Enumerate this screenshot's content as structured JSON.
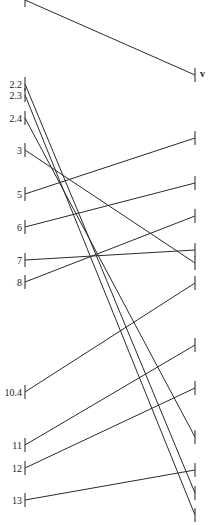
{
  "diagram": {
    "type": "tanglegram",
    "left_x": 25,
    "right_x": 195,
    "tick_half": 7,
    "marker": {
      "text": "v",
      "x": 200,
      "y": 77
    },
    "left_ticks": [
      {
        "id": "L0",
        "label": "",
        "y": 0
      },
      {
        "id": "L1",
        "label": "2.2",
        "y": 84
      },
      {
        "id": "L2",
        "label": "2.3",
        "y": 95
      },
      {
        "id": "L3",
        "label": "2.4",
        "y": 118
      },
      {
        "id": "L4",
        "label": "3",
        "y": 150
      },
      {
        "id": "L5",
        "label": "5",
        "y": 194
      },
      {
        "id": "L6",
        "label": "6",
        "y": 227
      },
      {
        "id": "L7",
        "label": "7",
        "y": 260
      },
      {
        "id": "L8",
        "label": "8",
        "y": 282
      },
      {
        "id": "L9",
        "label": "10.4",
        "y": 392
      },
      {
        "id": "L10",
        "label": "11",
        "y": 445
      },
      {
        "id": "L11",
        "label": "12",
        "y": 468
      },
      {
        "id": "L12",
        "label": "13",
        "y": 500
      }
    ],
    "right_ticks": [
      {
        "id": "R0",
        "y": 75
      },
      {
        "id": "R1",
        "y": 138
      },
      {
        "id": "R2",
        "y": 183
      },
      {
        "id": "R3",
        "y": 216
      },
      {
        "id": "R4",
        "y": 250
      },
      {
        "id": "R5",
        "y": 263
      },
      {
        "id": "R6",
        "y": 283
      },
      {
        "id": "R7",
        "y": 345
      },
      {
        "id": "R8",
        "y": 388
      },
      {
        "id": "R9",
        "y": 437
      },
      {
        "id": "R10",
        "y": 470
      },
      {
        "id": "R11",
        "y": 493
      },
      {
        "id": "R12",
        "y": 515
      }
    ],
    "connections": [
      {
        "from": "L0",
        "to": "R0"
      },
      {
        "from": "L1",
        "to": "R11"
      },
      {
        "from": "L2",
        "to": "R12"
      },
      {
        "from": "L3",
        "to": "R9"
      },
      {
        "from": "L4",
        "to": "R5"
      },
      {
        "from": "L5",
        "to": "R1"
      },
      {
        "from": "L6",
        "to": "R2"
      },
      {
        "from": "L7",
        "to": "R4"
      },
      {
        "from": "L8",
        "to": "R3"
      },
      {
        "from": "L9",
        "to": "R6"
      },
      {
        "from": "L10",
        "to": "R7"
      },
      {
        "from": "L11",
        "to": "R8"
      },
      {
        "from": "L12",
        "to": "R10"
      }
    ]
  }
}
